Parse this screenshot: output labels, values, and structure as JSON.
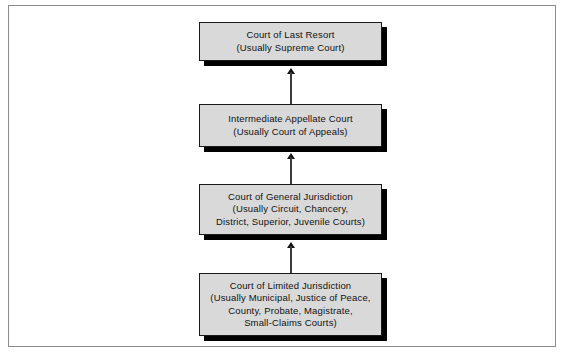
{
  "diagram": {
    "frame": {
      "border_color": "#8d8d8d",
      "background": "#ffffff"
    },
    "style": {
      "box_fill": "#d9d9d9",
      "box_border": "#1a1a1a",
      "box_shadow": "#000000",
      "text_color": "#111111",
      "arrow_color": "#111111"
    },
    "levels": [
      {
        "id": "court-of-last-resort",
        "name": "Court of Last Resort",
        "text": "Court of Last Resort\n(Usually Supreme Court)"
      },
      {
        "id": "intermediate-appellate-court",
        "name": "Intermediate Appellate Court",
        "text": "Intermediate Appellate Court\n(Usually Court of Appeals)"
      },
      {
        "id": "court-of-general-jurisdiction",
        "name": "Court of General Jurisdiction",
        "text": "Court of General Jurisdiction\n(Usually Circuit, Chancery,\nDistrict, Superior, Juvenile Courts)"
      },
      {
        "id": "court-of-limited-jurisdiction",
        "name": "Court of Limited Jurisdiction",
        "text": "Court of Limited Jurisdiction\n(Usually Municipal, Justice of Peace,\nCounty, Probate, Magistrate,\nSmall-Claims Courts)"
      }
    ],
    "connectors": [
      {
        "id": "appeal-arrow-general-to-limited",
        "direction": "up",
        "from": "court-of-limited-jurisdiction",
        "to": "court-of-general-jurisdiction"
      },
      {
        "id": "appeal-arrow-appellate-to-general",
        "direction": "up",
        "from": "court-of-general-jurisdiction",
        "to": "intermediate-appellate-court"
      },
      {
        "id": "appeal-arrow-last-resort-to-appellate",
        "direction": "up",
        "from": "intermediate-appellate-court",
        "to": "court-of-last-resort"
      }
    ]
  }
}
